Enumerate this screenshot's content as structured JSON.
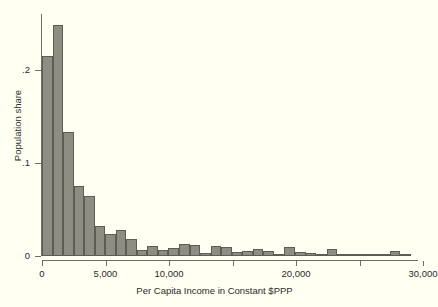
{
  "figure": {
    "background_color": "#fffff2",
    "bar_fill_color": "#8d8d83",
    "bar_outline_color": "#5d5d56",
    "axis_color": "#6e6e66"
  },
  "chart_data": {
    "type": "bar",
    "title": "",
    "subtitle": "",
    "xlabel": "Per Capita Income in Constant $PPP",
    "ylabel": "Population share",
    "xlim": [
      0,
      30000
    ],
    "ylim": [
      0,
      0.26
    ],
    "grid": false,
    "legend": null,
    "x_ticks": [
      0,
      5000,
      10000,
      15000,
      20000,
      25000,
      30000
    ],
    "x_tick_labels": [
      "0",
      "5,000",
      "10,000",
      "",
      "20,000",
      "",
      "30,000"
    ],
    "y_ticks": [
      0,
      0.1,
      0.2
    ],
    "y_tick_labels": [
      "0",
      ".1",
      ".2"
    ],
    "bin_width": 830,
    "bin_starts": [
      0,
      830,
      1660,
      2490,
      3320,
      4150,
      4980,
      5810,
      6640,
      7470,
      8300,
      9130,
      9960,
      10790,
      11620,
      12450,
      13280,
      14110,
      14940,
      15770,
      16600,
      17430,
      18260,
      19090,
      19920,
      20750,
      21580,
      22410,
      23240,
      24070,
      24900,
      25730,
      26560,
      27390,
      28220
    ],
    "values": [
      0.215,
      0.248,
      0.133,
      0.075,
      0.065,
      0.032,
      0.024,
      0.028,
      0.018,
      0.006,
      0.011,
      0.007,
      0.009,
      0.013,
      0.012,
      0.003,
      0.011,
      0.01,
      0.004,
      0.005,
      0.008,
      0.005,
      0.001,
      0.01,
      0.004,
      0.003,
      0.001,
      0.008,
      0.001,
      0.0005,
      0.001,
      0.002,
      0.0005,
      0.005,
      0.001
    ],
    "annotations": []
  }
}
